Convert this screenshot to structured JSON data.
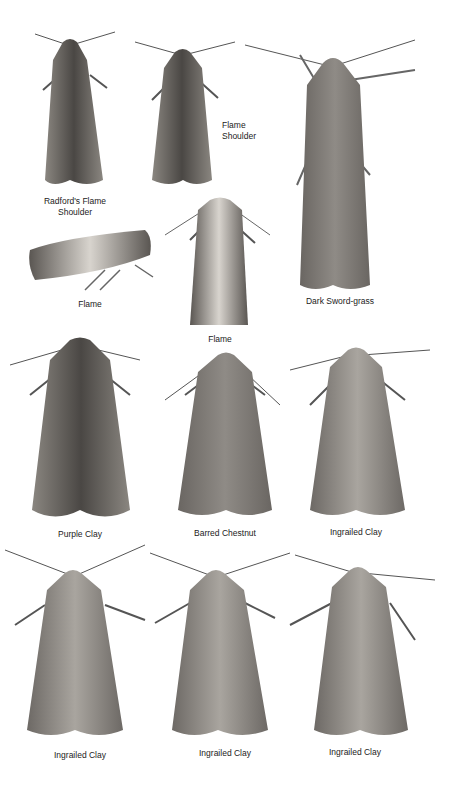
{
  "plate": {
    "specimens": [
      {
        "label": "Radford's Flame\nShoulder"
      },
      {
        "label": "Flame\nShoulder"
      },
      {
        "label": "Dark Sword-grass"
      },
      {
        "label": "Flame"
      },
      {
        "label": "Flame"
      },
      {
        "label": "Purple Clay"
      },
      {
        "label": "Barred Chestnut"
      },
      {
        "label": "Ingrailed Clay"
      },
      {
        "label": "Ingrailed Clay"
      },
      {
        "label": "Ingrailed Clay"
      },
      {
        "label": "Ingrailed Clay"
      }
    ]
  },
  "colors": {
    "background": "#ffffff",
    "text": "#222222",
    "moth_dark": "#4a4744",
    "moth_mid": "#7a7672",
    "moth_light": "#b8b4ae"
  }
}
